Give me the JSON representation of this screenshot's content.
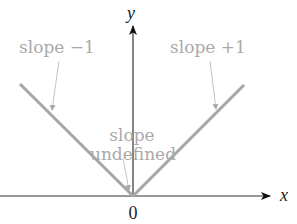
{
  "diagram": {
    "type": "absolute-value-graph",
    "axes": {
      "x_label": "x",
      "y_label": "y",
      "origin_label": "0"
    },
    "annotations": {
      "left": "slope −1",
      "right": "slope +1",
      "center_line1": "slope",
      "center_line2": "undefined"
    },
    "colors": {
      "graph_line": "#a6a6a6",
      "annotation_text": "#a9a9a9",
      "axis": "#222222"
    }
  }
}
